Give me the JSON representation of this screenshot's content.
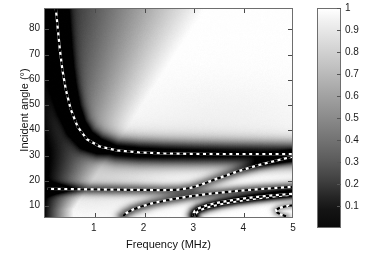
{
  "chart_data": {
    "type": "heatmap",
    "title": "",
    "xlabel": "Frequency (MHz)",
    "ylabel": "Incident angle (°)",
    "xlim": [
      0,
      5
    ],
    "ylim": [
      5,
      88
    ],
    "xticks": [
      1,
      2,
      3,
      4,
      5
    ],
    "xticklabels": [
      "1",
      "2",
      "3",
      "4",
      "5"
    ],
    "yticks": [
      10,
      20,
      30,
      40,
      50,
      60,
      70,
      80
    ],
    "yticklabels": [
      "10",
      "20",
      "30",
      "40",
      "50",
      "60",
      "70",
      "80"
    ],
    "grid": false,
    "legend": "none",
    "colormap": "gray",
    "colorbar": {
      "position": "right",
      "vmin": 0,
      "vmax": 1,
      "ticks": [
        0.1,
        0.2,
        0.3,
        0.4,
        0.5,
        0.6,
        0.7,
        0.8,
        0.9,
        1
      ],
      "ticklabels": [
        "0.1",
        "0.2",
        "0.3",
        "0.4",
        "0.5",
        "0.6",
        "0.7",
        "0.8",
        "0.9",
        "1"
      ],
      "label": ""
    },
    "z_description": "Reflection coefficient magnitude; dark bands mark minima where Lamb modes are excited. Background is dark (near 0) at low frequency/left edge, bright (near 1) over most of the map.",
    "overlay_curves": {
      "style": "black-and-white dashed",
      "description": "Theoretical Lamb-wave mode dispersion curves overlaid on the measured reflection map",
      "curves": [
        {
          "name": "mode-1-A0-branch",
          "points": [
            [
              0.22,
              88
            ],
            [
              0.26,
              80
            ],
            [
              0.3,
              72
            ],
            [
              0.35,
              64
            ],
            [
              0.42,
              56
            ],
            [
              0.52,
              48
            ],
            [
              0.66,
              41
            ],
            [
              0.85,
              36
            ],
            [
              1.1,
              33.2
            ],
            [
              1.45,
              31.6
            ],
            [
              1.9,
              30.8
            ],
            [
              2.4,
              30.4
            ],
            [
              3.0,
              30.2
            ],
            [
              3.7,
              30.1
            ],
            [
              4.4,
              30.1
            ],
            [
              5.0,
              30.1
            ]
          ]
        },
        {
          "name": "mode-2-S0-branch",
          "points": [
            [
              0.05,
              16.2
            ],
            [
              0.5,
              16.1
            ],
            [
              1.0,
              16.0
            ],
            [
              1.5,
              15.9
            ],
            [
              2.0,
              15.8
            ],
            [
              2.4,
              15.7
            ],
            [
              2.7,
              15.9
            ],
            [
              2.95,
              16.6
            ],
            [
              3.2,
              18.2
            ],
            [
              3.5,
              20.4
            ],
            [
              3.9,
              23.2
            ],
            [
              4.3,
              25.6
            ],
            [
              4.7,
              27.6
            ],
            [
              5.0,
              29.0
            ]
          ]
        },
        {
          "name": "mode-3-A1-branch",
          "points": [
            [
              1.58,
              5.4
            ],
            [
              1.65,
              6.6
            ],
            [
              1.78,
              8.0
            ],
            [
              1.95,
              9.2
            ],
            [
              2.2,
              10.6
            ],
            [
              2.55,
              12.0
            ],
            [
              2.95,
              13.3
            ],
            [
              3.4,
              14.4
            ],
            [
              3.9,
              15.4
            ],
            [
              4.4,
              16.2
            ],
            [
              5.0,
              17.0
            ]
          ]
        },
        {
          "name": "mode-4-S1-lower-branch",
          "points": [
            [
              3.02,
              5.2
            ],
            [
              3.05,
              6.4
            ],
            [
              3.12,
              7.6
            ],
            [
              3.28,
              8.8
            ],
            [
              3.55,
              10.1
            ],
            [
              3.9,
              11.3
            ],
            [
              4.3,
              12.4
            ],
            [
              4.7,
              13.3
            ],
            [
              5.0,
              13.9
            ]
          ]
        },
        {
          "name": "mode-4-S1-upper-turning-branch",
          "points": [
            [
              3.02,
              5.2
            ],
            [
              3.0,
              6.2
            ],
            [
              3.03,
              7.4
            ],
            [
              3.12,
              8.6
            ],
            [
              3.3,
              9.8
            ],
            [
              3.55,
              10.9
            ],
            [
              3.85,
              11.9
            ],
            [
              4.2,
              12.8
            ],
            [
              4.6,
              13.6
            ],
            [
              5.0,
              14.2
            ]
          ]
        },
        {
          "name": "mode-5-short-hook-branch",
          "points": [
            [
              4.88,
              5.3
            ],
            [
              4.78,
              5.9
            ],
            [
              4.7,
              6.8
            ],
            [
              4.68,
              7.8
            ],
            [
              4.74,
              8.6
            ],
            [
              4.86,
              9.2
            ],
            [
              5.0,
              9.6
            ]
          ]
        }
      ]
    }
  }
}
